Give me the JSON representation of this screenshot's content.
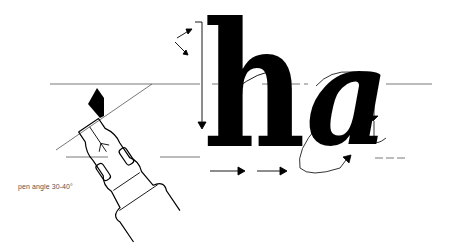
{
  "figure": {
    "caption": "pen angle 30-40°",
    "letters": [
      "h",
      "a"
    ],
    "colors": {
      "ink": "#000000",
      "guide": "#444444",
      "caption": "#555555",
      "background": "#ffffff"
    },
    "elements": {
      "pen": "calligraphy-pen-nib-icon",
      "guides": [
        "ascender-line",
        "x-height-line",
        "baseline"
      ],
      "arrows": [
        "stroke-direction-arrows",
        "serif-entry-arrows",
        "horizontal-spacing-arrows"
      ]
    }
  }
}
